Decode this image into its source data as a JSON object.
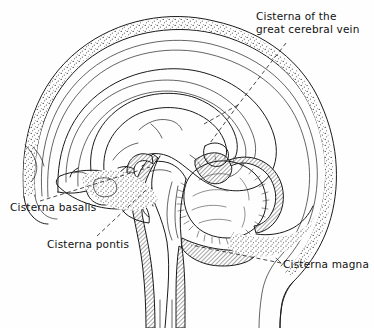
{
  "figure": {
    "background_color": "#fefefe",
    "ink_color": "#1a1a1a",
    "shading_color": "#9a9a9a",
    "stipple_color": "#444444"
  },
  "labels": {
    "great_cerebral_vein": {
      "line1": "Cisterna of the",
      "line2": "great cerebral vein"
    },
    "basalis": "Cisterna basalis",
    "pontis": "Cisterna pontis",
    "magna": "Cisterna magna"
  },
  "structures": [
    "scalp-outer-contour",
    "skull-inner-table",
    "diploe-stipple-band",
    "cerebral-hemisphere",
    "corpus-callosum",
    "cingulate-gyrus",
    "lateral-ventricle",
    "thalamus",
    "midbrain",
    "pons",
    "medulla-oblongata",
    "spinal-cord",
    "cerebellum",
    "tentorium-cerebelli",
    "sphenoid-bone",
    "sella-turcica",
    "frontal-sinus",
    "neck-contour"
  ],
  "cisternae": [
    "cisterna-of-great-cerebral-vein",
    "cisterna-basalis",
    "cisterna-pontis",
    "cisterna-magna"
  ]
}
